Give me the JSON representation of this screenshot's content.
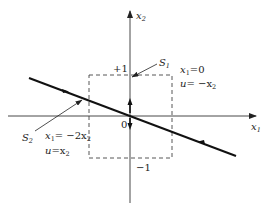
{
  "diagram": {
    "type": "phase-plane",
    "axes": {
      "horizontal": {
        "label": "x",
        "subscript": "1"
      },
      "vertical": {
        "label": "x",
        "subscript": "2"
      },
      "origin_label": "0"
    },
    "ticks": {
      "upper": "+1",
      "lower": "−1"
    },
    "switching_lines": {
      "s1": {
        "label": "S",
        "subscript": "1",
        "eq1": {
          "lhs": "x",
          "lhs_sub": "1",
          "rhs": "=0"
        },
        "eq2": {
          "lhs": "u",
          "rhs": "= −x",
          "rhs_sub": "2"
        }
      },
      "s2": {
        "label": "S",
        "subscript": "2",
        "eq1": {
          "lhs": "x",
          "lhs_sub": "1",
          "rhs": "= −2x",
          "rhs_sub": "2"
        },
        "eq2": {
          "lhs": "u",
          "rhs": "=x",
          "rhs_sub": "2"
        }
      }
    },
    "region": {
      "style": "dashed",
      "x_range": [
        -1,
        1
      ],
      "y_range": [
        -1,
        1
      ]
    }
  }
}
